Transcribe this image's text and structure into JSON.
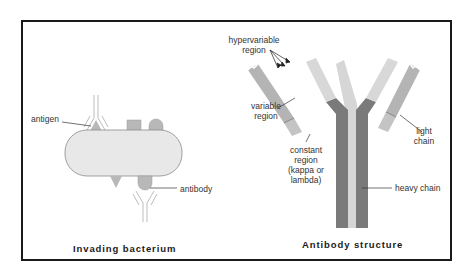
{
  "figure": {
    "panels": [
      {
        "id": "invading-bacterium",
        "caption": "Invading bacterium",
        "labels": {
          "antigen": "antigen",
          "antibody": "antibody"
        }
      },
      {
        "id": "antibody-structure",
        "caption": "Antibody structure",
        "labels": {
          "hypervariable_line1": "hypervariable",
          "hypervariable_line2": "region",
          "variable_line1": "variable",
          "variable_line2": "region",
          "constant_line1": "constant",
          "constant_line2": "region",
          "constant_line3": "(kappa or",
          "constant_line4": "lambda)",
          "light_line1": "light",
          "light_line2": "chain",
          "heavy_chain": "heavy chain"
        }
      }
    ]
  },
  "colors": {
    "frame": "#1a1a1a",
    "bacterium_fill": "#e8e8e8",
    "antigen_fill": "#b8b8b8",
    "heavy_chain": "#7a7a7a",
    "light_chain_variable": "#d8d8d8",
    "light_chain_mid": "#b4b4b4",
    "light_chain_constant": "#c4c4c4",
    "leader_line": "#333333"
  }
}
